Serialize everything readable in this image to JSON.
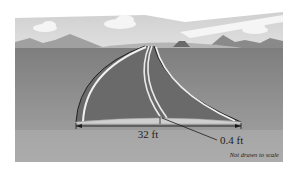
{
  "figure": {
    "type": "road-crown-illustration",
    "labels": {
      "width": "32 ft",
      "crown_height": "0.4 ft",
      "note": "Not drawn to scale"
    },
    "colors": {
      "sky": "#d9d9d9",
      "cloud": "#f4f4f4",
      "mountains": "#a8a8a8",
      "ground": "#8e8e8e",
      "road": "#6e6e6e",
      "road_edge": "#2a2a2a",
      "lane_line": "#f0f0f0",
      "cross_section": "#c8c8c8",
      "dimension_line": "#1a1a1a"
    }
  }
}
